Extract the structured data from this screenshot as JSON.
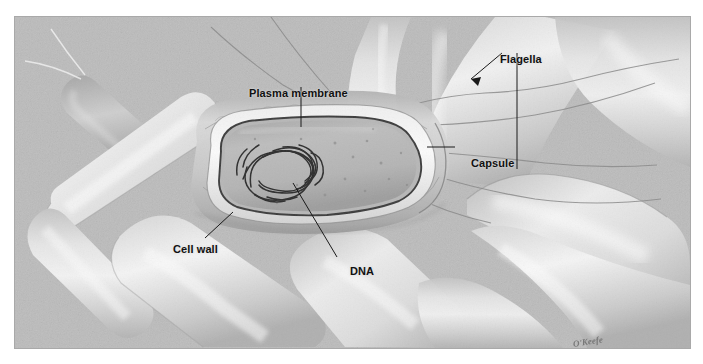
{
  "figure": {
    "medium": "grayscale airbrush scientific illustration",
    "signature": "O'Keefe",
    "background_color": "#b9b9b9",
    "frame_color": "#ffffff",
    "ink_color": "#111111"
  },
  "labels": [
    {
      "id": "plasma-membrane",
      "text": "Plasma membrane",
      "text_x": 234,
      "text_y": 70,
      "leader": [
        [
          300,
          84
        ],
        [
          300,
          122
        ]
      ],
      "arrowhead": false
    },
    {
      "id": "flagella",
      "text": "Flagella",
      "text_x": 485,
      "text_y": 36,
      "leader": [
        [
          500,
          50
        ],
        [
          471,
          78
        ]
      ],
      "leader2": [
        [
          516,
          50
        ],
        [
          516,
          165
        ]
      ],
      "arrowhead": true
    },
    {
      "id": "capsule",
      "text": "Capsule",
      "text_x": 456,
      "text_y": 140,
      "leader": [
        [
          452,
          147
        ],
        [
          424,
          147
        ]
      ],
      "arrowhead": false
    },
    {
      "id": "cell-wall",
      "text": "Cell wall",
      "text_x": 158,
      "text_y": 226,
      "leader": [
        [
          204,
          227
        ],
        [
          232,
          200
        ]
      ],
      "arrowhead": false
    },
    {
      "id": "dna",
      "text": "DNA",
      "text_x": 335,
      "text_y": 248,
      "leader": [
        [
          336,
          246
        ],
        [
          293,
          172
        ]
      ],
      "arrowhead": false
    }
  ],
  "structures": {
    "central_cell": {
      "name": "cutaway bacterium",
      "layers": [
        "capsule",
        "cell wall",
        "plasma membrane",
        "cytoplasm",
        "DNA nucleoid"
      ],
      "orientation": "horizontal rod, sectioned"
    },
    "surrounding_cells": {
      "name": "neighbouring rod-shaped bacteria",
      "count": 9
    },
    "flagella": {
      "name": "flagella filaments",
      "description": "thin whip-like filaments trailing from cells"
    }
  }
}
